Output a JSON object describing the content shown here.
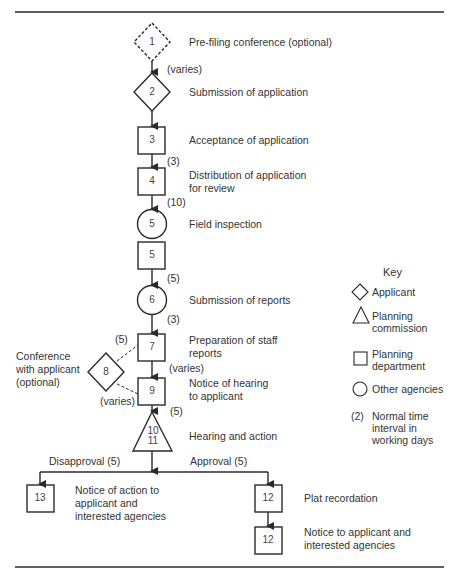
{
  "diagram": {
    "steps": [
      {
        "id": "1",
        "shape": "diamond",
        "style": "dashed",
        "actor": "Applicant",
        "label": "Pre-filing conference (optional)"
      },
      {
        "id": "2",
        "shape": "diamond",
        "actor": "Applicant",
        "label": "Submission of application"
      },
      {
        "id": "3",
        "shape": "square",
        "actor": "Planning department",
        "label": "Acceptance of application"
      },
      {
        "id": "4",
        "shape": "square",
        "actor": "Planning department",
        "label_lines": [
          "Distribution of application",
          "for review"
        ]
      },
      {
        "id": "5",
        "shape": "circle",
        "actor": "Other agencies",
        "label": "Field inspection"
      },
      {
        "id": "5",
        "shape": "square",
        "actor": "Planning department",
        "label": ""
      },
      {
        "id": "6",
        "shape": "circle",
        "actor": "Other agencies",
        "label": "Submission of reports"
      },
      {
        "id": "7",
        "shape": "square",
        "actor": "Planning department",
        "label_lines": [
          "Preparation of staff",
          "reports"
        ]
      },
      {
        "id": "8",
        "shape": "diamond",
        "actor": "Applicant",
        "label_lines": [
          "Conference",
          "with applicant",
          "(optional)"
        ]
      },
      {
        "id": "9",
        "shape": "square",
        "actor": "Planning department",
        "label_lines": [
          "Notice of hearing",
          "to applicant"
        ]
      },
      {
        "id": "10 11",
        "shape": "triangle",
        "actor": "Planning commission",
        "label": "Hearing and action",
        "num_lines": [
          "10",
          "11"
        ]
      },
      {
        "id": "13",
        "shape": "square",
        "actor": "Planning department",
        "label_lines": [
          "Notice of action to",
          "applicant and",
          "interested agencies"
        ]
      },
      {
        "id": "12",
        "shape": "square",
        "actor": "Planning department",
        "label": "Plat recordation"
      },
      {
        "id": "12",
        "shape": "square",
        "actor": "Planning department",
        "label_lines": [
          "Notice to applicant and",
          "interested agencies"
        ]
      }
    ],
    "intervals": {
      "i1_2": "(varies)",
      "i3_4": "(3)",
      "i4_5": "(10)",
      "i5_6": "(5)",
      "i6_7": "(3)",
      "i7_8": "(5)",
      "i7_9": "(varies)",
      "i8_9": "(varies)",
      "i9_10": "(5)"
    },
    "branches": {
      "disapproval": "Disapproval (5)",
      "approval": "Approval (5)"
    },
    "key": {
      "title": "Key",
      "items": [
        {
          "symbol": "diamond-icon",
          "label": "Applicant"
        },
        {
          "symbol": "triangle-icon",
          "label_lines": [
            "Planning",
            "commission"
          ]
        },
        {
          "symbol": "square-icon",
          "label_lines": [
            "Planning",
            "department"
          ]
        },
        {
          "symbol": "circle-icon",
          "label": "Other agencies"
        },
        {
          "symbol": "(2)",
          "label_lines": [
            "Normal time",
            "interval in",
            "working days"
          ]
        }
      ]
    },
    "colors": {
      "stroke": "#2a2a2a",
      "text": "#333333",
      "background": "#ffffff"
    }
  }
}
